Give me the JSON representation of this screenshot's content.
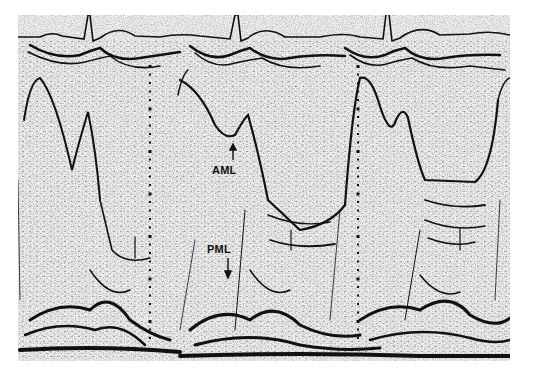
{
  "figure": {
    "type": "M-mode echocardiogram",
    "background": "#f2f2f2",
    "ink": "#111111",
    "ecg": {
      "qrs_x": [
        90,
        240,
        390
      ]
    },
    "time_markers_x": [
      150,
      358
    ],
    "labels": [
      {
        "id": "aml",
        "text": "AML",
        "x": 212,
        "y": 165,
        "arrow_to": [
          233,
          147
        ]
      },
      {
        "id": "pml",
        "text": "PML",
        "x": 207,
        "y": 244,
        "arrow_to": [
          228,
          278
        ]
      }
    ]
  }
}
